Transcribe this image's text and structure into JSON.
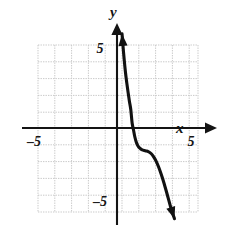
{
  "figure": {
    "name": "cartesian-graph",
    "background_color": "#ffffff",
    "axis_color": "#141414",
    "grid_color": "#c9c9c9",
    "curve_color": "#111111"
  },
  "axes": {
    "x_axis_label": "x",
    "y_axis_label": "y",
    "x_tick_labels": [
      "–5",
      "5"
    ],
    "y_tick_labels": [
      "5",
      "–5"
    ],
    "x_range": [
      -5.2,
      5.2
    ],
    "y_range": [
      -5.4,
      5.6
    ],
    "grid": true,
    "grid_step": 1,
    "grid_extent_x": [
      -4.6,
      4.75
    ],
    "grid_extent_y": [
      -4.95,
      4.9
    ]
  },
  "chart_data": {
    "type": "line",
    "title": "",
    "xlabel": "x",
    "ylabel": "y",
    "xlim": [
      -5.2,
      5.2
    ],
    "ylim": [
      -5.4,
      5.6
    ],
    "grid": true,
    "legend": "none",
    "annotations": [
      "decreasing cubic with horizontal inflection plateau near (1.5, -1.3)",
      "x-intercept near x = 0.95",
      "arrowheads on both curve ends"
    ],
    "series": [
      {
        "name": "curve",
        "x": [
          0.3,
          0.36,
          0.43,
          0.5,
          0.58,
          0.66,
          0.74,
          0.82,
          0.9,
          0.98,
          1.06,
          1.14,
          1.22,
          1.3,
          1.4,
          1.5,
          1.62,
          1.74,
          1.86,
          1.98,
          2.1,
          2.22,
          2.34,
          2.46,
          2.58,
          2.7,
          2.82,
          2.94,
          3.06,
          3.18,
          3.3,
          3.42
        ],
        "y": [
          5.6,
          4.85,
          4.05,
          3.35,
          2.7,
          2.12,
          1.58,
          1.1,
          0.3,
          -0.1,
          -0.52,
          -0.82,
          -1.02,
          -1.15,
          -1.24,
          -1.3,
          -1.34,
          -1.37,
          -1.41,
          -1.48,
          -1.6,
          -1.78,
          -2.0,
          -2.28,
          -2.6,
          -2.96,
          -3.36,
          -3.78,
          -4.22,
          -4.66,
          -5.05,
          -5.4
        ]
      }
    ]
  }
}
